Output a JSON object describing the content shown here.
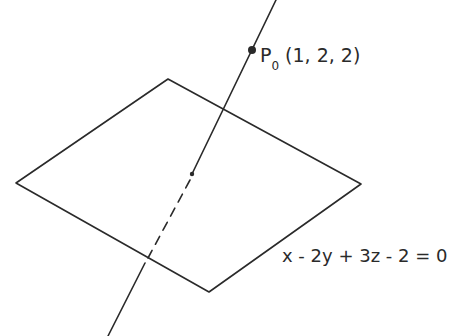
{
  "diagram": {
    "point": {
      "name": "P",
      "subscript": "0",
      "coords": "(1, 2, 2)"
    },
    "plane": {
      "equation": "x - 2y + 3z - 2 = 0"
    },
    "colors": {
      "ink": "#2a2a2a",
      "background": "#ffffff"
    }
  }
}
